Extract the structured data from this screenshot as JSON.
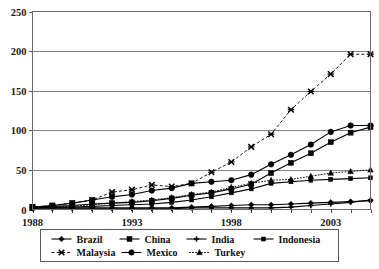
{
  "chart_data": {
    "type": "line",
    "title": "",
    "xlabel": "",
    "ylabel": "",
    "xlim": [
      1988,
      2005
    ],
    "ylim": [
      0,
      250
    ],
    "yticks": [
      0,
      50,
      100,
      150,
      200,
      250
    ],
    "xticks": [
      1988,
      1993,
      1998,
      2003
    ],
    "grid": true,
    "legend_position": "bottom",
    "x": [
      1988,
      1989,
      1990,
      1991,
      1992,
      1993,
      1994,
      1995,
      1996,
      1997,
      1998,
      1999,
      2000,
      2001,
      2002,
      2003,
      2004,
      2005
    ],
    "series": [
      {
        "name": "Brazil",
        "marker": "diamond",
        "line": "solid",
        "values": [
          2,
          2,
          2,
          2,
          2,
          2,
          2,
          2,
          3,
          4,
          5,
          6,
          6,
          7,
          8,
          9,
          10,
          11
        ]
      },
      {
        "name": "China",
        "marker": "square",
        "line": "solid",
        "values": [
          3,
          4,
          5,
          7,
          8,
          9,
          11,
          14,
          18,
          21,
          26,
          32,
          46,
          59,
          71,
          85,
          97,
          104
        ]
      },
      {
        "name": "India",
        "marker": "cross",
        "line": "solid",
        "values": [
          1,
          1,
          1,
          1,
          1,
          1,
          1,
          1,
          2,
          2,
          2,
          2,
          2,
          3,
          5,
          7,
          9,
          12
        ]
      },
      {
        "name": "Indonesia",
        "marker": "square-small",
        "line": "solid",
        "values": [
          2,
          3,
          3,
          4,
          5,
          6,
          7,
          9,
          12,
          16,
          21,
          26,
          33,
          35,
          37,
          38,
          39,
          40
        ]
      },
      {
        "name": "Malaysia",
        "marker": "x-star",
        "line": "dashed",
        "values": [
          3,
          5,
          8,
          12,
          22,
          25,
          31,
          29,
          33,
          47,
          60,
          79,
          95,
          126,
          149,
          171,
          196,
          196
        ]
      },
      {
        "name": "Mexico",
        "marker": "circle",
        "line": "solid",
        "values": [
          3,
          5,
          8,
          12,
          16,
          19,
          24,
          27,
          33,
          35,
          37,
          44,
          57,
          69,
          82,
          98,
          106,
          106
        ]
      },
      {
        "name": "Turkey",
        "marker": "triangle",
        "line": "dotted",
        "values": [
          2,
          3,
          4,
          6,
          8,
          10,
          12,
          15,
          19,
          22,
          28,
          33,
          37,
          38,
          42,
          46,
          48,
          50
        ]
      }
    ]
  },
  "axis": {
    "ytick_labels": [
      "0",
      "50",
      "100",
      "150",
      "200",
      "250"
    ],
    "xtick_labels": [
      "1988",
      "1993",
      "1998",
      "2003"
    ]
  },
  "legend": {
    "row1": [
      {
        "label": "Brazil",
        "marker": "diamond",
        "line": "solid"
      },
      {
        "label": "China",
        "marker": "square",
        "line": "solid"
      },
      {
        "label": "India",
        "marker": "cross",
        "line": "solid"
      },
      {
        "label": "Indonesia",
        "marker": "square-small",
        "line": "solid"
      }
    ],
    "row2": [
      {
        "label": "Malaysia",
        "marker": "x-star",
        "line": "dashed"
      },
      {
        "label": "Mexico",
        "marker": "circle",
        "line": "solid"
      },
      {
        "label": "Turkey",
        "marker": "triangle",
        "line": "dotted"
      }
    ]
  },
  "colors": {
    "background": "#ffffff",
    "grid": "#808080",
    "series": "#000000",
    "frame": "#6b6b6b"
  }
}
